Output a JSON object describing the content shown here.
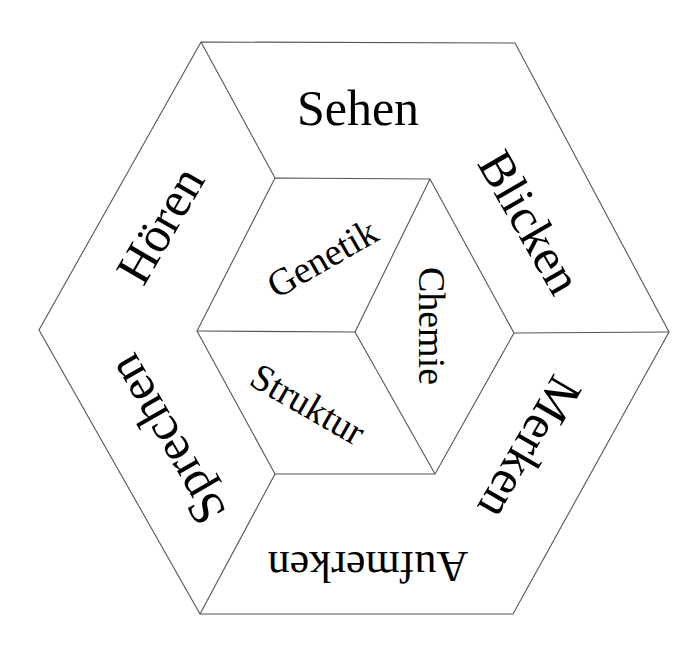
{
  "diagram": {
    "title": "",
    "outer_ring": {
      "labels": [
        {
          "id": "sehen",
          "text": "Sehen"
        },
        {
          "id": "blicken",
          "text": "Blicken"
        },
        {
          "id": "merken",
          "text": "Merken"
        },
        {
          "id": "aufmerken",
          "text": "Aufmerken"
        },
        {
          "id": "sprechen",
          "text": "Sprechen"
        },
        {
          "id": "hoeren",
          "text": "Hören"
        }
      ]
    },
    "inner_cube": {
      "labels": [
        {
          "id": "genetik",
          "text": "Genetik"
        },
        {
          "id": "chemie",
          "text": "Chemie"
        },
        {
          "id": "struktur",
          "text": "Struktur"
        }
      ]
    },
    "colors": {
      "line": "#555555",
      "text": "#000000",
      "background": "#ffffff"
    }
  }
}
